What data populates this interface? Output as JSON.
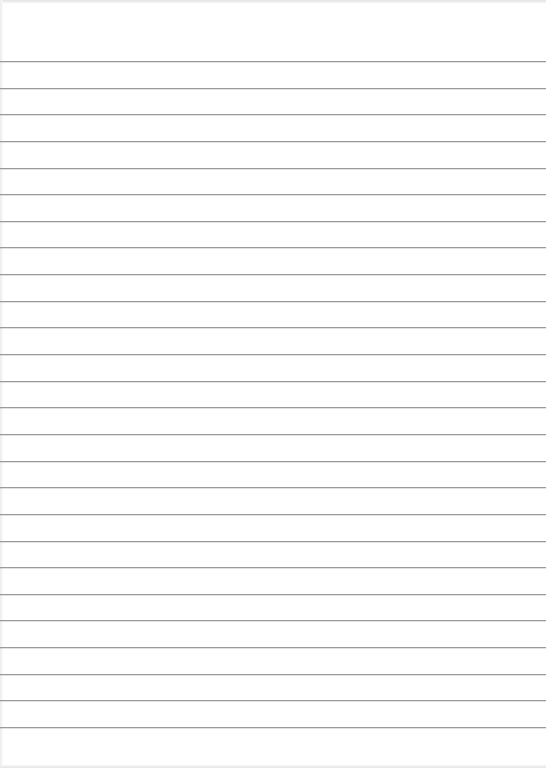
{
  "page": {
    "type": "lined-paper",
    "background_color": "#ffffff",
    "line_color": "#9a9a9a",
    "line_count": 26,
    "first_line_y": 61,
    "line_spacing": 26.64
  }
}
